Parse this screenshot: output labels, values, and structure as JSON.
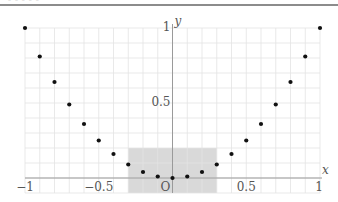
{
  "topbar": {
    "cropped_text": "– – – – –"
  },
  "chart_data": {
    "type": "scatter",
    "title": "",
    "xlabel": "x",
    "ylabel": "y",
    "xlim": [
      -1,
      1
    ],
    "ylim": [
      -0.1,
      1
    ],
    "grid": true,
    "grid_step": 0.1,
    "x_ticks": [
      {
        "value": -1,
        "label": "−1"
      },
      {
        "value": -0.5,
        "label": "−0.5"
      },
      {
        "value": 0,
        "label": "O"
      },
      {
        "value": 0.5,
        "label": "0.5"
      },
      {
        "value": 1,
        "label": "1"
      }
    ],
    "y_ticks": [
      {
        "value": 0.5,
        "label": "0.5"
      },
      {
        "value": 1,
        "label": "1"
      }
    ],
    "shaded_region": {
      "x": [
        -0.3,
        0.3
      ],
      "y": [
        -0.1,
        0.2
      ],
      "color": "#d9d9d9"
    },
    "series": [
      {
        "name": "y = x^2 samples",
        "color": "#111111",
        "x": [
          -1,
          -0.9,
          -0.8,
          -0.7,
          -0.6,
          -0.5,
          -0.4,
          -0.3,
          -0.2,
          -0.1,
          0,
          0.1,
          0.2,
          0.3,
          0.4,
          0.5,
          0.6,
          0.7,
          0.8,
          0.9,
          1
        ],
        "y": [
          1,
          0.81,
          0.64,
          0.49,
          0.36,
          0.25,
          0.16,
          0.09,
          0.04,
          0.01,
          0,
          0.01,
          0.04,
          0.09,
          0.16,
          0.25,
          0.36,
          0.49,
          0.64,
          0.81,
          1
        ]
      }
    ],
    "colors": {
      "grid": "#e3e3e3",
      "axis": "#9a9a9a",
      "text": "#555555"
    }
  }
}
